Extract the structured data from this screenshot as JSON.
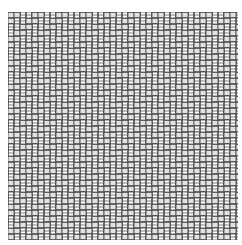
{
  "image": {
    "description": "Stepped twill / herringbone weave pattern of ladder-like bars",
    "background": "#ffffff",
    "stroke_color": "#444444",
    "fill_color": "#e2e2e2",
    "region": {
      "x": 8,
      "y": 12,
      "width": 230,
      "height": 228
    }
  },
  "pattern": {
    "cell": 6,
    "bar_length_cells": 4,
    "twill_period_cells": 8
  }
}
